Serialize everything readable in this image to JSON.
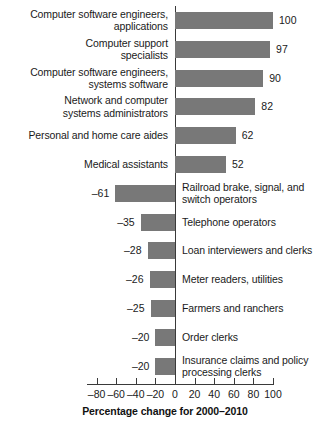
{
  "chart_data": {
    "type": "bar",
    "orientation": "horizontal",
    "title": "",
    "xlabel": "Percentage change for 2000–2010",
    "ylabel": "",
    "xlim": [
      -90,
      105
    ],
    "grid": false,
    "legend": "none",
    "axis_ticks": [
      {
        "value": -80,
        "label": "–80"
      },
      {
        "value": -60,
        "label": "–60"
      },
      {
        "value": -40,
        "label": "–40"
      },
      {
        "value": -20,
        "label": "–20"
      },
      {
        "value": 0,
        "label": "0"
      },
      {
        "value": 20,
        "label": "20"
      },
      {
        "value": 40,
        "label": "40"
      },
      {
        "value": 60,
        "label": "60"
      },
      {
        "value": 80,
        "label": "80"
      },
      {
        "value": 100,
        "label": "100"
      }
    ],
    "bar_color": "#787878",
    "axis_color": "#3a3a3a",
    "categories": [
      "Computer software engineers, applications",
      "Computer support specialists",
      "Computer software engineers, systems software",
      "Network and computer systems administrators",
      "Personal and home care aides",
      "Medical assistants",
      "Railroad brake, signal, and switch operators",
      "Telephone operators",
      "Loan interviewers and clerks",
      "Meter readers, utilities",
      "Farmers and ranchers",
      "Order clerks",
      "Insurance claims and policy processing clerks"
    ],
    "values": [
      100,
      97,
      90,
      82,
      62,
      52,
      -61,
      -35,
      -28,
      -26,
      -25,
      -20,
      -20
    ]
  },
  "rows": [
    {
      "label": "Computer software engineers,\napplications",
      "value": 100,
      "value_label": "100",
      "label_side": "left"
    },
    {
      "label": "Computer support\nspecialists",
      "value": 97,
      "value_label": "97",
      "label_side": "left"
    },
    {
      "label": "Computer software engineers,\nsystems software",
      "value": 90,
      "value_label": "90",
      "label_side": "left"
    },
    {
      "label": "Network and computer\nsystems administrators",
      "value": 82,
      "value_label": "82",
      "label_side": "left"
    },
    {
      "label": "Personal and home care aides",
      "value": 62,
      "value_label": "62",
      "label_side": "left"
    },
    {
      "label": "Medical assistants",
      "value": 52,
      "value_label": "52",
      "label_side": "left"
    },
    {
      "label": "Railroad brake, signal, and\nswitch operators",
      "value": -61,
      "value_label": "–61",
      "label_side": "right"
    },
    {
      "label": "Telephone operators",
      "value": -35,
      "value_label": "–35",
      "label_side": "right"
    },
    {
      "label": "Loan interviewers and clerks",
      "value": -28,
      "value_label": "–28",
      "label_side": "right"
    },
    {
      "label": "Meter readers, utilities",
      "value": -26,
      "value_label": "–26",
      "label_side": "right"
    },
    {
      "label": "Farmers and ranchers",
      "value": -25,
      "value_label": "–25",
      "label_side": "right"
    },
    {
      "label": "Order clerks",
      "value": -20,
      "value_label": "–20",
      "label_side": "right"
    },
    {
      "label": "Insurance claims and policy\nprocessing clerks",
      "value": -20,
      "value_label": "–20",
      "label_side": "right"
    }
  ],
  "axis": {
    "title": "Percentage change for 2000–2010",
    "ticks": [
      "–80",
      "–60",
      "–40",
      "–20",
      "0",
      "20",
      "40",
      "60",
      "80",
      "100"
    ],
    "tick_values": [
      -80,
      -60,
      -40,
      -20,
      0,
      20,
      40,
      60,
      80,
      100
    ]
  }
}
